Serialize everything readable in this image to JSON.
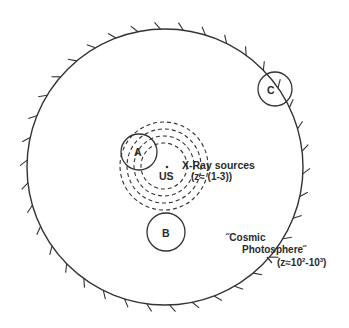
{
  "diagram": {
    "colors": {
      "line": "#333333",
      "text": "#2a2a2a",
      "background": "#ffffff"
    },
    "outer_circle": {
      "name": "cosmic-photosphere-boundary",
      "cx": 165,
      "cy": 167,
      "r": 138,
      "tick_count": 38,
      "tick_length": 7
    },
    "dashed_circles": {
      "name": "x-ray-source-shells",
      "cx": 164,
      "cy": 166,
      "radii": [
        23,
        30,
        37,
        44
      ]
    },
    "small_circles": [
      {
        "id": "A",
        "label": "A",
        "cx": 139,
        "cy": 152,
        "r": 18
      },
      {
        "id": "B",
        "label": "B",
        "cx": 166,
        "cy": 232,
        "r": 19
      },
      {
        "id": "C",
        "label": "C",
        "cx": 275,
        "cy": 89,
        "r": 17
      }
    ],
    "observer": {
      "label": "US",
      "dot_x": 167,
      "dot_y": 167
    },
    "labels": {
      "xray_line1": "X-Ray  sources",
      "xray_line2": "(z≈ (1-3))",
      "photosphere_line1": "˝Cosmic",
      "photosphere_line2": "Photosphere˝",
      "photosphere_line3_prefix": "(z≈10",
      "photosphere_exp1": "2",
      "photosphere_mid": "-10",
      "photosphere_exp2": "3",
      "photosphere_suffix": ")"
    }
  }
}
